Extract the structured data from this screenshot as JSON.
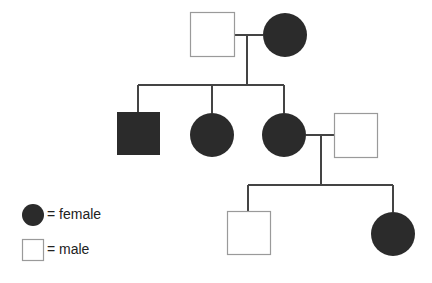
{
  "diagram": {
    "type": "pedigree",
    "colors": {
      "line": "#444444",
      "affected_fill": "#2b2b2b",
      "unaffected_fill": "#ffffff",
      "unaffected_stroke": "#9a9a9a"
    },
    "generations": [
      {
        "id": "I",
        "individuals": [
          {
            "id": "I-1",
            "sex": "male",
            "affected": false
          },
          {
            "id": "I-2",
            "sex": "female",
            "affected": true
          }
        ]
      },
      {
        "id": "II",
        "individuals": [
          {
            "id": "II-1",
            "sex": "male",
            "affected": true
          },
          {
            "id": "II-2",
            "sex": "female",
            "affected": true
          },
          {
            "id": "II-3",
            "sex": "female",
            "affected": true
          },
          {
            "id": "II-4",
            "sex": "male",
            "affected": false,
            "note": "spouse of II-3"
          }
        ]
      },
      {
        "id": "III",
        "individuals": [
          {
            "id": "III-1",
            "sex": "male",
            "affected": false
          },
          {
            "id": "III-2",
            "sex": "female",
            "affected": true
          }
        ]
      }
    ]
  },
  "legend": {
    "female_label": "= female",
    "male_label": "= male"
  }
}
